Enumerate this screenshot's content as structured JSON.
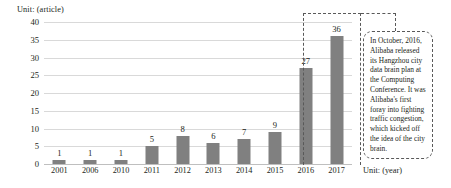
{
  "chart_data": {
    "type": "bar",
    "title": "",
    "xlabel": "Unit: (year)",
    "ylabel": "Unit: (article)",
    "categories": [
      "2001",
      "2006",
      "2010",
      "2011",
      "2012",
      "2013",
      "2014",
      "2015",
      "2016",
      "2017"
    ],
    "values": [
      1,
      1,
      1,
      5,
      8,
      6,
      7,
      9,
      27,
      36
    ],
    "value_labels": [
      "1",
      "1",
      "1",
      "5",
      "8",
      "6",
      "7",
      "9",
      "27",
      "36"
    ],
    "ylim": [
      0,
      40
    ],
    "yticks": [
      "0",
      "5",
      "10",
      "15",
      "20",
      "25",
      "30",
      "35",
      "40"
    ],
    "grid": true,
    "legend": "none",
    "bar_color": "#808080",
    "gridline_color": "#d9d9d9",
    "annotations": [
      {
        "name": "city-brain-callout",
        "text": "In October, 2016, Alibaba released its Hangzhou city data brain plan at the Computing Conference. It was Alibaba's first foray into fighting traffic congestion, which kicked off the idea of the city brain.",
        "highlights": [
          "2016",
          "2017"
        ],
        "border_color": "#595959",
        "border_style": "dashed"
      }
    ]
  },
  "labels": {
    "unit_article": "Unit: (article)",
    "unit_year": "Unit: (year)"
  }
}
